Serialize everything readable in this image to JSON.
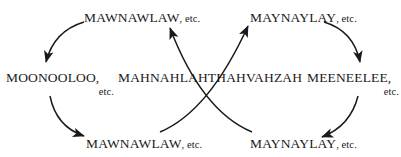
{
  "diagram": {
    "background_color": "#ffffff",
    "ink_color": "#1a1a1a",
    "nodes": [
      {
        "id": "top-left",
        "word": "MAWNAWLAW",
        "suffix": ", etc.",
        "layout": "inline"
      },
      {
        "id": "top-right",
        "word": "MAYNAYLAY",
        "suffix": ", etc.",
        "layout": "inline"
      },
      {
        "id": "left",
        "word": "MOONOOLOO,",
        "suffix": "etc.",
        "layout": "stacked"
      },
      {
        "id": "center",
        "word": "MAHNAHLAHTHAHVAHZAH",
        "suffix": "",
        "layout": "inline"
      },
      {
        "id": "right",
        "word": "MEENEELEE,",
        "suffix": "etc.",
        "layout": "stacked"
      },
      {
        "id": "bottom-left",
        "word": "MAWNAWLAW",
        "suffix": ", etc.",
        "layout": "inline"
      },
      {
        "id": "bottom-right",
        "word": "MAYNAYLAY",
        "suffix": ", etc.",
        "layout": "inline"
      }
    ],
    "arrows": [
      {
        "id": "arc-topleft-to-left",
        "from": "top-left",
        "to": "left",
        "direction": "down-left"
      },
      {
        "id": "arc-left-to-bottomleft",
        "from": "left",
        "to": "bottom-left",
        "direction": "down-right"
      },
      {
        "id": "arc-center-to-topleft",
        "from": "center",
        "to": "top-left",
        "direction": "up-left"
      },
      {
        "id": "arc-center-to-topright",
        "from": "center",
        "to": "top-right",
        "direction": "up-right"
      },
      {
        "id": "arc-topright-to-right",
        "from": "top-right",
        "to": "right",
        "direction": "down-right"
      },
      {
        "id": "arc-right-to-bottomright",
        "from": "right",
        "to": "bottom-right",
        "direction": "down-left"
      }
    ]
  }
}
